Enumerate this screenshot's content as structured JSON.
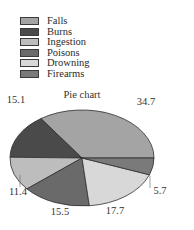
{
  "chart_data": {
    "type": "pie",
    "title": "Pie chart",
    "categories": [
      "Falls",
      "Burns",
      "Ingestion",
      "Poisons",
      "Drowning",
      "Firearms"
    ],
    "values": [
      34.7,
      15.1,
      11.4,
      15.5,
      17.7,
      5.7
    ],
    "colors": [
      "#a4a4a4",
      "#4a4a4a",
      "#bdbdbd",
      "#6a6a6a",
      "#d8d8d8",
      "#7a7a7a"
    ],
    "value_labels": [
      "34.7",
      "15.1",
      "11.4",
      "15.5",
      "17.7",
      "5.7"
    ],
    "legend_position": "top-left",
    "start_angle_deg": 0,
    "direction": "counterclockwise",
    "style": "3d-tilted-ellipse"
  },
  "legend": {
    "items": [
      {
        "label": "Falls",
        "color": "#a4a4a4"
      },
      {
        "label": "Burns",
        "color": "#4a4a4a"
      },
      {
        "label": "Ingestion",
        "color": "#bdbdbd"
      },
      {
        "label": "Poisons",
        "color": "#6a6a6a"
      },
      {
        "label": "Drowning",
        "color": "#d8d8d8"
      },
      {
        "label": "Firearms",
        "color": "#7a7a7a"
      }
    ]
  }
}
